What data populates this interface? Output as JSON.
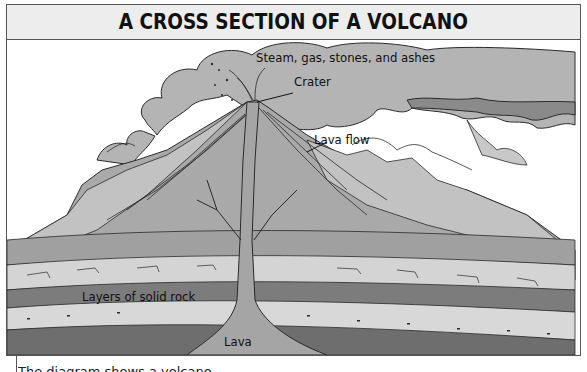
{
  "title": "A CROSS SECTION OF A VOLCANO",
  "labels": {
    "plume": "Steam, gas, stones, and ashes",
    "crater": "Crater",
    "lava_flow": "Lava flow",
    "rock_layers": "Layers of solid rock",
    "lava": "Lava"
  },
  "caption": "The diagram shows a volcano",
  "colors": {
    "background": "#ffffff",
    "title_bar": "#ededed",
    "plume": "#b4b4b4",
    "plume_dark": "#8a8a8a",
    "volcano": "#a9a9a9",
    "slope_light": "#c2c2c2",
    "rock_light": "#d4d4d4",
    "rock_mid": "#bdbdbd",
    "rock_dark": "#7c7c7c",
    "lava": "#a5a5a5",
    "outline": "#2a2a2a"
  }
}
